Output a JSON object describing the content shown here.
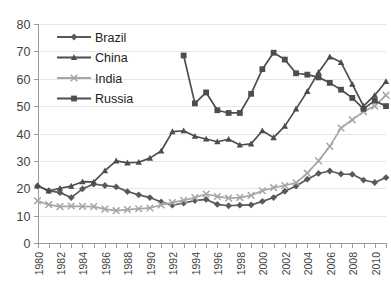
{
  "chart_data": {
    "type": "line",
    "title": "",
    "xlabel": "",
    "ylabel": "",
    "ylim": [
      0,
      80
    ],
    "ytick_step": 10,
    "yticks": [
      0,
      10,
      20,
      30,
      40,
      50,
      60,
      70,
      80
    ],
    "xlim": [
      1980,
      2011
    ],
    "xticks_all_years": true,
    "xtick_label_step": 2,
    "xtick_labels": [
      "1980",
      "1982",
      "1984",
      "1986",
      "1988",
      "1990",
      "1992",
      "1994",
      "1996",
      "1998",
      "2000",
      "2002",
      "2004",
      "2006",
      "2008",
      "2010"
    ],
    "x": [
      1980,
      1981,
      1982,
      1983,
      1984,
      1985,
      1986,
      1987,
      1988,
      1989,
      1990,
      1991,
      1992,
      1993,
      1994,
      1995,
      1996,
      1997,
      1998,
      1999,
      2000,
      2001,
      2002,
      2003,
      2004,
      2005,
      2006,
      2007,
      2008,
      2009,
      2010,
      2011
    ],
    "grid": true,
    "legend_position": "upper-left-inside",
    "series": [
      {
        "name": "Brazil",
        "color": "#595959",
        "marker": "diamond",
        "values": [
          20.8,
          19.1,
          18.4,
          16.6,
          19.8,
          21.5,
          21.0,
          20.5,
          18.8,
          17.6,
          16.6,
          15.0,
          13.8,
          14.6,
          15.5,
          15.9,
          14.1,
          13.6,
          13.8,
          13.9,
          15.2,
          16.6,
          18.9,
          20.8,
          23.3,
          25.4,
          26.3,
          25.2,
          25.1,
          23.0,
          22.1,
          23.9
        ]
      },
      {
        "name": "China",
        "color": "#4d4d4d",
        "marker": "triangle",
        "values": [
          21.0,
          19.0,
          20.0,
          20.8,
          22.4,
          22.3,
          26.4,
          30.0,
          29.3,
          29.5,
          31.0,
          33.6,
          40.7,
          41.0,
          39.0,
          38.0,
          37.0,
          37.9,
          35.8,
          36.2,
          41.0,
          38.5,
          42.7,
          49.0,
          55.4,
          62.4,
          68.0,
          66.0,
          58.0,
          50.0,
          54.0,
          59.0
        ]
      },
      {
        "name": "India",
        "color": "#a6a6a6",
        "marker": "x",
        "values": [
          15.4,
          14.0,
          13.3,
          13.5,
          13.4,
          13.3,
          12.4,
          11.8,
          12.2,
          12.5,
          12.8,
          13.9,
          14.8,
          15.6,
          16.6,
          17.9,
          17.0,
          16.4,
          16.6,
          17.4,
          19.1,
          20.2,
          21.0,
          22.0,
          25.5,
          30.0,
          35.3,
          42.0,
          45.0,
          48.0,
          50.0,
          54.0
        ]
      },
      {
        "name": "Russia",
        "color": "#4d4d4d",
        "marker": "square",
        "values": [
          null,
          null,
          null,
          null,
          null,
          null,
          null,
          null,
          null,
          null,
          null,
          null,
          null,
          68.5,
          51.0,
          55.0,
          48.5,
          47.5,
          47.5,
          54.5,
          63.5,
          69.5,
          67.0,
          62.0,
          61.5,
          60.5,
          58.5,
          56.0,
          53.0,
          49.0,
          52.0,
          50.0
        ]
      }
    ]
  },
  "legend": {
    "items": [
      {
        "label": "Brazil"
      },
      {
        "label": "China"
      },
      {
        "label": "India"
      },
      {
        "label": "Russia"
      }
    ]
  },
  "topstrip": {
    "text": ""
  }
}
